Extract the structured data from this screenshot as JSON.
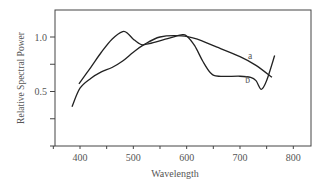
{
  "chart_data": {
    "type": "line",
    "title": "",
    "xlabel": "Wavelength",
    "ylabel": "Relative Spectral Power",
    "xlim": [
      360,
      835
    ],
    "ylim": [
      0,
      1.25
    ],
    "xticks": [
      400,
      500,
      600,
      700,
      800
    ],
    "xtick_labels": [
      "400",
      "500",
      "600",
      "700",
      "800"
    ],
    "yticks": [
      0.5,
      1.0
    ],
    "ytick_labels": [
      "0.5",
      "1.0"
    ],
    "grid": false,
    "legend": "inline labels",
    "series": [
      {
        "name": "a",
        "x": [
          385,
          400,
          420,
          440,
          460,
          480,
          500,
          520,
          550,
          590,
          620,
          650,
          700,
          730,
          760
        ],
        "values": [
          0.36,
          0.53,
          0.62,
          0.68,
          0.72,
          0.78,
          0.86,
          0.93,
          1.0,
          1.01,
          0.98,
          0.92,
          0.82,
          0.74,
          0.63
        ]
      },
      {
        "name": "b",
        "x": [
          398,
          420,
          440,
          460,
          480,
          490,
          500,
          515,
          530,
          560,
          590,
          600,
          615,
          630,
          645,
          660,
          700,
          720,
          730,
          740,
          750,
          765
        ],
        "values": [
          0.57,
          0.72,
          0.86,
          0.98,
          1.05,
          1.03,
          0.98,
          0.93,
          0.94,
          0.98,
          1.02,
          1.01,
          0.92,
          0.78,
          0.67,
          0.64,
          0.64,
          0.63,
          0.6,
          0.52,
          0.6,
          0.83
        ]
      }
    ],
    "annotations": [
      {
        "text": "a",
        "x": 715,
        "y": 0.8
      },
      {
        "text": "b",
        "x": 710,
        "y": 0.58
      }
    ]
  }
}
